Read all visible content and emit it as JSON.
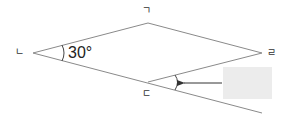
{
  "figure": {
    "type": "rhombus-with-extended-side",
    "vertices": {
      "left": {
        "label": "ㄴ",
        "x": 33,
        "y": 53
      },
      "top": {
        "label": "ㄱ",
        "x": 148,
        "y": 23
      },
      "right": {
        "label": "ㄹ",
        "x": 262,
        "y": 53
      },
      "bottom": {
        "label": "ㄷ",
        "x": 148,
        "y": 82
      }
    },
    "known_angle": {
      "vertex": "ㄴ",
      "value": "30°"
    },
    "unknown_angle": {
      "vertex": "ㄷ",
      "description": "exterior angle between side ㄷㄹ and extension of side ㄴㄷ",
      "value": ""
    },
    "colors": {
      "line": "#8a8a8a",
      "answer_box": "#ececec",
      "arrow": "#333333"
    }
  }
}
